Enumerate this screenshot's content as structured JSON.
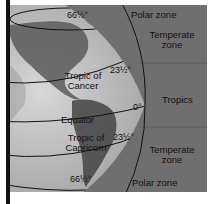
{
  "diagram": {
    "zones": [
      {
        "label": "Polar zone",
        "position": "top"
      },
      {
        "label_line1": "Temperate",
        "label_line2": "zone",
        "position": "north"
      },
      {
        "label": "Tropics",
        "position": "middle"
      },
      {
        "label_line1": "Temperate",
        "label_line2": "zone",
        "position": "south"
      },
      {
        "label": "Polar zone",
        "position": "bottom"
      }
    ],
    "latitude_lines": [
      {
        "name": "Arctic circle",
        "degree": "66½°"
      },
      {
        "name_line1": "Tropic of",
        "name_line2": "Cancer",
        "degree": "23½°"
      },
      {
        "name": "Equator",
        "degree": "0°"
      },
      {
        "name_line1": "Tropic of",
        "name_line2": "Capricorn",
        "degree": "23½°"
      },
      {
        "name": "Antarctic circle",
        "degree": "66½°"
      }
    ],
    "colors": {
      "background": "#6f6f6f",
      "globe_light": "#c9c9c9",
      "globe_dark": "#4a4a4a",
      "line": "#111111"
    }
  }
}
